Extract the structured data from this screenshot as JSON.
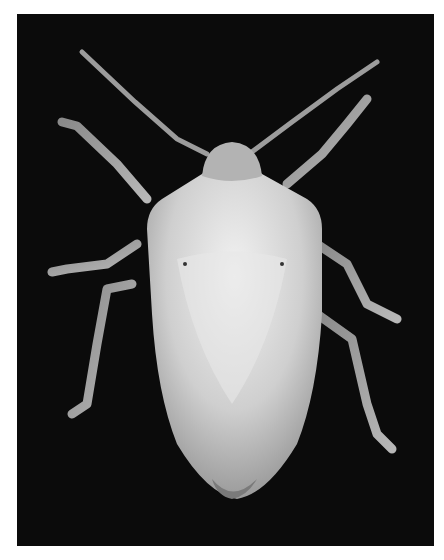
{
  "image": {
    "subject": "stink bug (shield bug), dorsal view",
    "background": "black",
    "tone": "grayscale",
    "colors": {
      "frame_bg": "#0b0b0b",
      "body": "#d9d9d9",
      "legs": "#a9a9a9",
      "page_bg": "#ffffff"
    }
  }
}
